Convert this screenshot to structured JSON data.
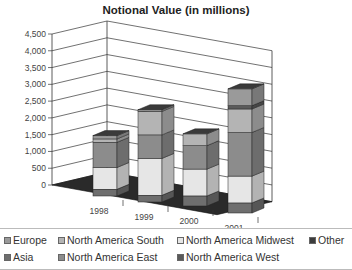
{
  "chart_data": {
    "type": "bar",
    "stacked": true,
    "three_d": true,
    "title": "Notional Value (in millions)",
    "xlabel": "",
    "ylabel": "",
    "categories": [
      "1998",
      "1999",
      "2000",
      "2001"
    ],
    "y_ticks": [
      "0",
      "500",
      "1,000",
      "1,500",
      "2,000",
      "2,500",
      "3,000",
      "3,500",
      "4,000",
      "4,500"
    ],
    "ylim": [
      0,
      4500
    ],
    "grid": true,
    "legend_position": "bottom",
    "series": [
      {
        "name": "Asia",
        "color": "#6e6e6e",
        "values": [
          200,
          200,
          300,
          300
        ]
      },
      {
        "name": "North America Midwest",
        "color": "#e6e6e6",
        "values": [
          650,
          1100,
          800,
          800
        ]
      },
      {
        "name": "North America East",
        "color": "#8c8c8c",
        "values": [
          750,
          700,
          700,
          1300
        ]
      },
      {
        "name": "North America South",
        "color": "#b4b4b4",
        "values": [
          100,
          700,
          350,
          700
        ]
      },
      {
        "name": "North America West",
        "color": "#5a5a5a",
        "values": [
          0,
          0,
          0,
          100
        ]
      },
      {
        "name": "Europe",
        "color": "#9a9a9a",
        "values": [
          100,
          50,
          0,
          500
        ]
      },
      {
        "name": "Other",
        "color": "#3c3c3c",
        "values": [
          0,
          0,
          0,
          0
        ]
      }
    ]
  },
  "legend": {
    "items": [
      {
        "label": "Europe",
        "color": "#9a9a9a"
      },
      {
        "label": "North America South",
        "color": "#b4b4b4"
      },
      {
        "label": "North America Midwest",
        "color": "#e6e6e6"
      },
      {
        "label": "Other",
        "color": "#3c3c3c"
      },
      {
        "label": "Asia",
        "color": "#6e6e6e"
      },
      {
        "label": "North America East",
        "color": "#8c8c8c"
      },
      {
        "label": "North America West",
        "color": "#5a5a5a"
      }
    ]
  }
}
